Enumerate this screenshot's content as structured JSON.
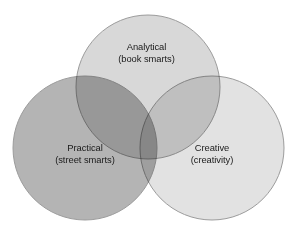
{
  "figure": {
    "type": "venn-diagram",
    "background_color": "#ffffff",
    "width": 297,
    "height": 230,
    "circle_count": 3,
    "outline_color": "#9b9b9b",
    "text_color": "#1b1b1b"
  },
  "sets": [
    {
      "id": "analytical",
      "title": "Analytical",
      "subtitle": "(book smarts)",
      "fill_color": "#d8d8d8",
      "position": "top",
      "center_x": 148,
      "center_y": 87,
      "radius": 72
    },
    {
      "id": "practical",
      "title": "Practical",
      "subtitle": "(street smarts)",
      "fill_color": "#b4b4b4",
      "position": "bottom-left",
      "center_x": 85,
      "center_y": 148,
      "radius": 72
    },
    {
      "id": "creative",
      "title": "Creative",
      "subtitle": "(creativity)",
      "fill_color": "#e2e2e2",
      "position": "bottom-right",
      "center_x": 212,
      "center_y": 148,
      "radius": 72
    }
  ],
  "overlaps": {
    "triple_center_color": "#9a9a9a",
    "analytical_practical_color": "#b0b0b0",
    "analytical_creative_color": "#cdcdcd",
    "practical_creative_color": "#b8b8b8"
  }
}
